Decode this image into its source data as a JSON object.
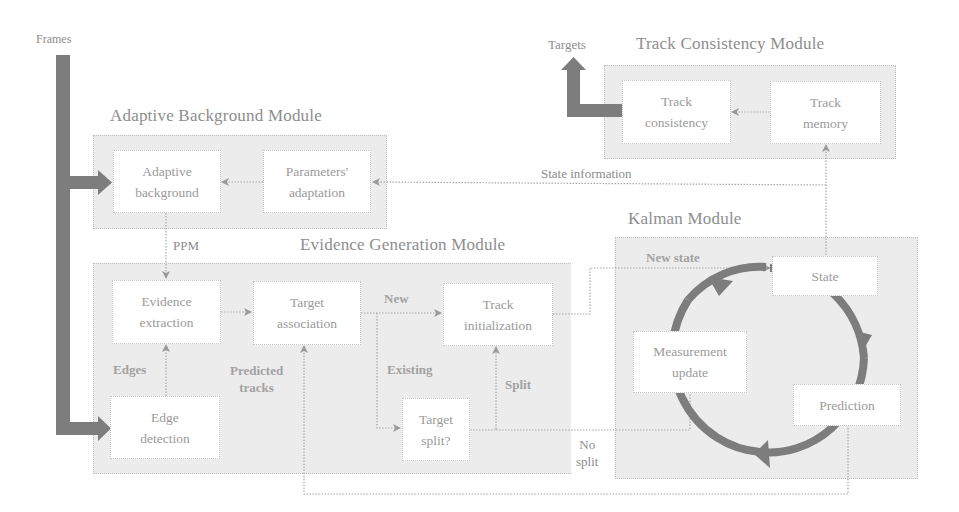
{
  "diagram": {
    "inputs": {
      "frames": "Frames"
    },
    "outputs": {
      "targets": "Targets"
    },
    "modules": {
      "adaptive_background": {
        "title": "Adaptive Background Module",
        "nodes": {
          "adaptive_background": [
            "Adaptive",
            "background"
          ],
          "parameters_adaptation": [
            "Parameters'",
            "adaptation"
          ]
        }
      },
      "evidence_generation": {
        "title": "Evidence Generation Module",
        "nodes": {
          "evidence_extraction": [
            "Evidence",
            "extraction"
          ],
          "target_association": [
            "Target",
            "association"
          ],
          "track_initialization": [
            "Track",
            "initialization"
          ],
          "edge_detection": [
            "Edge",
            "detection"
          ],
          "target_split": [
            "Target",
            "split?"
          ]
        }
      },
      "kalman": {
        "title": "Kalman Module",
        "nodes": {
          "state": "State",
          "measurement_update": [
            "Measurement",
            "update"
          ],
          "prediction": "Prediction"
        }
      },
      "track_consistency": {
        "title": "Track Consistency Module",
        "nodes": {
          "track_consistency": [
            "Track",
            "consistency"
          ],
          "track_memory": [
            "Track",
            "memory"
          ]
        }
      }
    },
    "edge_labels": {
      "ppm": "PPM",
      "edges": "Edges",
      "predicted_tracks": [
        "Predicted",
        "tracks"
      ],
      "new": "New",
      "existing": "Existing",
      "split": "Split",
      "no_split": [
        "No",
        "split"
      ],
      "new_state": "New state",
      "state_information": "State information"
    },
    "colors": {
      "module_fill": "#ececec",
      "node_fill": "#ffffff",
      "thick_arrow": "#7a7a7a",
      "thin_line": "#a8a8a8",
      "text": "#8a8a8a"
    }
  }
}
